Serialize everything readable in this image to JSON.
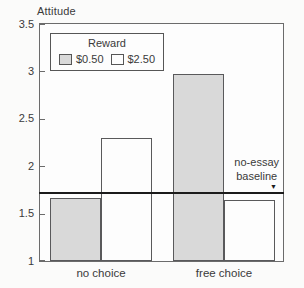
{
  "figure": {
    "axis_title": "Attitude",
    "annotation": {
      "line1": "no-essay",
      "line2": "baseline",
      "marker": "▼"
    },
    "legend": {
      "title": "Reward"
    }
  },
  "chart_data": {
    "type": "bar",
    "title": "Attitude",
    "ylabel": "Attitude",
    "categories": [
      "no choice",
      "free choice"
    ],
    "series": [
      {
        "name": "$0.50",
        "color": "#d9d9d9",
        "values": [
          1.66,
          2.97
        ]
      },
      {
        "name": "$2.50",
        "color": "#fdfdfd",
        "values": [
          2.3,
          1.64
        ]
      }
    ],
    "ylim": [
      1,
      3.5
    ],
    "yticks": [
      "1",
      "1.5",
      "2",
      "2.5",
      "3",
      "3.5"
    ],
    "baseline": {
      "value": 1.72,
      "label": "no-essay baseline"
    },
    "legend_position": "top-left-inside",
    "grid": false
  },
  "colors": {
    "bar_gray": "#d9d9d9",
    "bar_white": "#fdfdfd",
    "frame_line": "#6b6b6b",
    "bar_border": "#59595b",
    "baseline_line": "#1b1b1b",
    "text": "#3a3a3a"
  }
}
